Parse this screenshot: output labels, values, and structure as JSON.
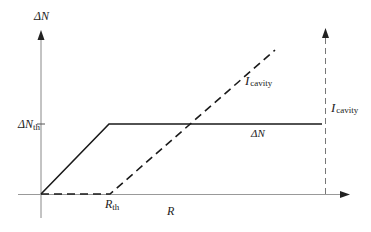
{
  "diagram": {
    "y_axis_label": {
      "symbol": "ΔN",
      "main": "ΔN"
    },
    "x_axis_label": "R",
    "threshold_y_label": {
      "main": "ΔN",
      "sub": "th"
    },
    "threshold_x_label": {
      "main": "R",
      "sub": "th"
    },
    "curve_delta_n_label": "ΔN",
    "curve_cavity_label": {
      "main": "I",
      "sub": "cavity"
    },
    "right_axis_label": {
      "main": "I",
      "sub": "cavity"
    },
    "colors": {
      "axis": "#888888",
      "solid_line": "#1a1a1a",
      "dashed_line": "#1a1a1a",
      "right_axis": "#777777"
    },
    "curves": [
      {
        "name": "ΔN",
        "style": "solid",
        "points": [
          [
            0,
            0
          ],
          [
            "R_th",
            "ΔN_th"
          ],
          [
            "max",
            "ΔN_th"
          ]
        ]
      },
      {
        "name": "I_cavity",
        "style": "dashed",
        "points": [
          [
            0,
            0
          ],
          [
            "R_th",
            0
          ],
          [
            "beyond",
            "rising linearly"
          ]
        ]
      }
    ]
  }
}
